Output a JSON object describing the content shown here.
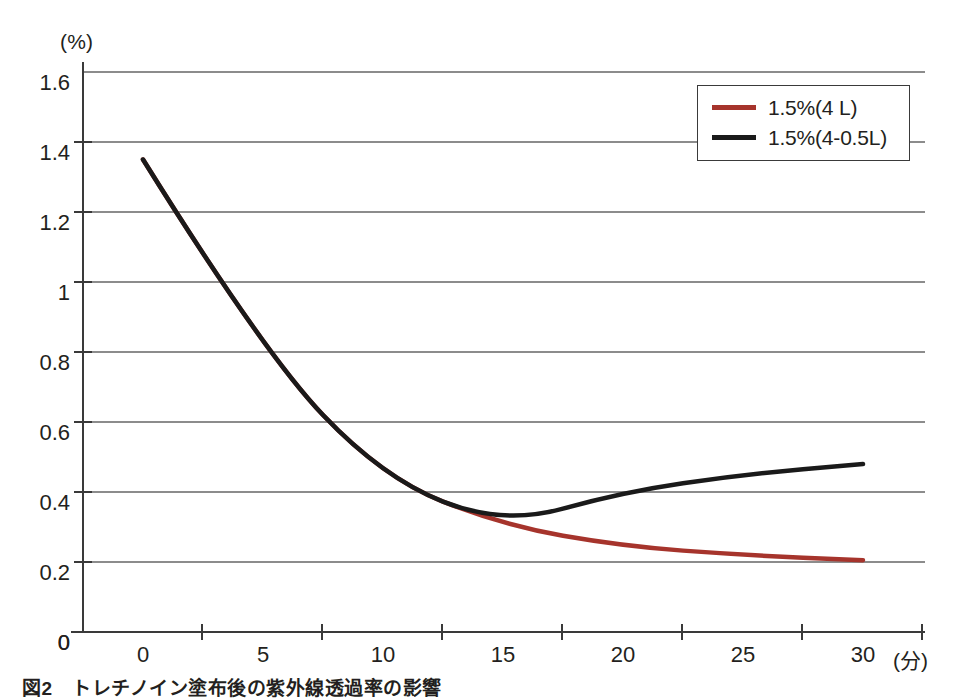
{
  "chart_data": {
    "type": "line",
    "title": "",
    "xlabel": "(分)",
    "ylabel": "(%)",
    "x": [
      0,
      5,
      10,
      15,
      20,
      25,
      30
    ],
    "xlim": [
      0,
      30
    ],
    "ylim": [
      0,
      1.6
    ],
    "xticks": [
      "0",
      "5",
      "10",
      "15",
      "20",
      "25",
      "30"
    ],
    "yticks": [
      "0",
      "0.2",
      "0.4",
      "0.6",
      "0.8",
      "1",
      "1.2",
      "1.4",
      "1.6"
    ],
    "ytick_values": [
      0,
      0.2,
      0.4,
      0.6,
      0.8,
      1.0,
      1.2,
      1.4,
      1.6
    ],
    "grid": "horizontal",
    "legend_position": "top-right",
    "series": [
      {
        "name": "1.5%(4 L)",
        "color": "#a6342c",
        "values": [
          1.35,
          0.8,
          0.44,
          0.305,
          0.245,
          0.22,
          0.205
        ]
      },
      {
        "name": "1.5%(4-0.5L)",
        "color": "#1a1a1a",
        "values": [
          1.35,
          0.8,
          0.44,
          0.305,
          0.4,
          0.45,
          0.48
        ]
      }
    ]
  },
  "legend": {
    "items": [
      {
        "label": "1.5%(4 L)",
        "color": "#a6342c"
      },
      {
        "label": "1.5%(4-0.5L)",
        "color": "#1a1a1a"
      }
    ]
  },
  "axis": {
    "y_unit": "(%)",
    "x_unit": "(分)",
    "origin_label": "0"
  },
  "caption": {
    "text": "図2　トレチノイン塗布後の紫外線透過率の影響"
  },
  "colors": {
    "series_red": "#a6342c",
    "series_black": "#1a1a1a",
    "axis": "#3a3a3a",
    "grid": "#8c8c8c",
    "background": "#ffffff"
  }
}
